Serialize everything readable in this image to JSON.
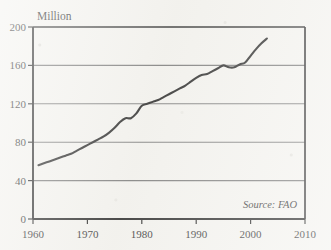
{
  "chart_data": {
    "type": "line",
    "title": "",
    "unit_label": "Million",
    "xlabel": "",
    "ylabel": "Million",
    "xlim": [
      1960,
      2010
    ],
    "ylim": [
      0,
      200
    ],
    "xticks": [
      1960,
      1970,
      1980,
      1990,
      2000,
      2010
    ],
    "yticks": [
      0,
      40,
      80,
      120,
      160,
      200
    ],
    "grid": "horizontal",
    "legend": "none",
    "annotation": "Source: FAO",
    "series": [
      {
        "name": "Production",
        "x": [
          1961,
          1962,
          1963,
          1964,
          1965,
          1966,
          1967,
          1968,
          1969,
          1970,
          1971,
          1972,
          1973,
          1974,
          1975,
          1976,
          1977,
          1978,
          1979,
          1980,
          1981,
          1982,
          1983,
          1984,
          1985,
          1986,
          1987,
          1988,
          1989,
          1990,
          1991,
          1992,
          1993,
          1994,
          1995,
          1996,
          1997,
          1998,
          1999,
          2000,
          2001,
          2002,
          2003
        ],
        "values": [
          56,
          58,
          60,
          62,
          64,
          66,
          68,
          71,
          74,
          77,
          80,
          83,
          86,
          90,
          95,
          101,
          105,
          105,
          110,
          118,
          120,
          122,
          124,
          127,
          130,
          133,
          136,
          139,
          143,
          147,
          150,
          151,
          154,
          157,
          160,
          158,
          158,
          161,
          163,
          170,
          177,
          183,
          188
        ]
      }
    ]
  },
  "axis": {
    "y_title": "Million",
    "y_tick_labels": [
      "200",
      "160",
      "120",
      "80",
      "40",
      "0"
    ],
    "x_tick_labels": [
      "1960",
      "1970",
      "1980",
      "1990",
      "2000",
      "2010"
    ]
  },
  "source": {
    "text": "Source: FAO"
  },
  "colors": {
    "line": "#141414",
    "axis": "#141414",
    "grid": "#6e6e6e",
    "background": "#f3f2ee",
    "text": "#1a1a1a"
  }
}
